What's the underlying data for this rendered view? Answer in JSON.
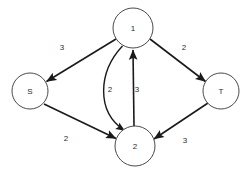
{
  "graph": {
    "type": "directed-weighted-graph",
    "background_color": "#ffffff",
    "node_stroke_color": "#4a4a4a",
    "edge_color": "#1a1a1a",
    "text_color": "#2b2b2b",
    "nodes": [
      {
        "id": "1",
        "label": "1",
        "cx": 133,
        "cy": 28,
        "r": 20
      },
      {
        "id": "S",
        "label": "S",
        "cx": 30,
        "cy": 91,
        "r": 18
      },
      {
        "id": "T",
        "label": "T",
        "cx": 221,
        "cy": 91,
        "r": 18
      },
      {
        "id": "2",
        "label": "2",
        "cx": 135,
        "cy": 146,
        "r": 20
      }
    ],
    "edges": [
      {
        "id": "e1",
        "from": "1",
        "to": "S",
        "weight": "3",
        "shape": "straight",
        "label_x": 62,
        "label_y": 47
      },
      {
        "id": "e2",
        "from": "1",
        "to": "T",
        "weight": "2",
        "shape": "straight",
        "label_x": 184,
        "label_y": 47
      },
      {
        "id": "e3",
        "from": "S",
        "to": "2",
        "weight": "2",
        "shape": "straight",
        "label_x": 66,
        "label_y": 138
      },
      {
        "id": "e4",
        "from": "T",
        "to": "2",
        "weight": "3",
        "shape": "straight",
        "label_x": 185,
        "label_y": 140
      },
      {
        "id": "e5",
        "from": "1",
        "to": "2",
        "weight": "2",
        "shape": "curved",
        "label_x": 110,
        "label_y": 89
      },
      {
        "id": "e6",
        "from": "2",
        "to": "1",
        "weight": "3",
        "shape": "straight",
        "label_x": 137,
        "label_y": 89
      }
    ]
  }
}
